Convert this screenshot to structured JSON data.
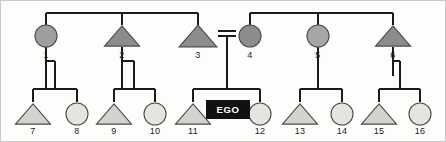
{
  "diagram": {
    "type": "pedigree",
    "width": 446,
    "height": 142,
    "background": "#fdfdfc",
    "border_color": "#c9c9c9",
    "line_color": "#1b1b1b",
    "ego_label": "EGO",
    "ego_box_color": "#111111",
    "ego_text_color": "#ffffff",
    "union_symbol": "=",
    "generations": 2,
    "legend": {
      "male_symbol": "triangle",
      "female_symbol": "circle",
      "ego_symbol": "black-box"
    },
    "fills": {
      "dark_gray": "#8c8c8c",
      "medium_gray": "#9e9e9e",
      "light_gray": "#d8d8d4",
      "pale_gray": "#e8e8e4"
    },
    "persons": [
      {
        "id": "1",
        "label": "1",
        "sex": "female",
        "shape": "circle",
        "generation": 1,
        "fill": "#9e9e9e",
        "cx": 45,
        "cy": 35,
        "r": 11,
        "label_x": 45,
        "label_y": 57
      },
      {
        "id": "2",
        "label": "2",
        "sex": "male",
        "shape": "triangle",
        "generation": 1,
        "fill": "#8c8c8c",
        "cx": 121,
        "cy": 35,
        "r": 13,
        "label_x": 121,
        "label_y": 57
      },
      {
        "id": "3",
        "label": "3",
        "sex": "male",
        "shape": "triangle",
        "generation": 1,
        "fill": "#8c8c8c",
        "cx": 197,
        "cy": 35,
        "r": 14,
        "label_x": 197,
        "label_y": 57
      },
      {
        "id": "4",
        "label": "4",
        "sex": "female",
        "shape": "circle",
        "generation": 1,
        "fill": "#8c8c8c",
        "cx": 249,
        "cy": 35,
        "r": 11,
        "label_x": 249,
        "label_y": 57
      },
      {
        "id": "5",
        "label": "5",
        "sex": "female",
        "shape": "circle",
        "generation": 1,
        "fill": "#a6a6a6",
        "cx": 317,
        "cy": 35,
        "r": 11,
        "label_x": 317,
        "label_y": 57
      },
      {
        "id": "6",
        "label": "6",
        "sex": "male",
        "shape": "triangle",
        "generation": 1,
        "fill": "#8c8c8c",
        "cx": 392,
        "cy": 35,
        "r": 13,
        "label_x": 392,
        "label_y": 57
      },
      {
        "id": "7",
        "label": "7",
        "sex": "male",
        "shape": "triangle",
        "generation": 2,
        "fill": "#d2d2ce",
        "cx": 32,
        "cy": 113,
        "r": 13,
        "label_x": 32,
        "label_y": 133
      },
      {
        "id": "8",
        "label": "8",
        "sex": "female",
        "shape": "circle",
        "generation": 2,
        "fill": "#e4e4e0",
        "cx": 76,
        "cy": 113,
        "r": 11,
        "label_x": 76,
        "label_y": 133
      },
      {
        "id": "9",
        "label": "9",
        "sex": "male",
        "shape": "triangle",
        "generation": 2,
        "fill": "#d2d2ce",
        "cx": 113,
        "cy": 113,
        "r": 13,
        "label_x": 113,
        "label_y": 133
      },
      {
        "id": "10",
        "label": "10",
        "sex": "female",
        "shape": "circle",
        "generation": 2,
        "fill": "#e4e4e0",
        "cx": 154,
        "cy": 113,
        "r": 11,
        "label_x": 154,
        "label_y": 133
      },
      {
        "id": "11",
        "label": "11",
        "sex": "male",
        "shape": "triangle",
        "generation": 2,
        "fill": "#d2d2ce",
        "cx": 192,
        "cy": 113,
        "r": 13,
        "label_x": 192,
        "label_y": 133
      },
      {
        "id": "12",
        "label": "12",
        "sex": "female",
        "shape": "circle",
        "generation": 2,
        "fill": "#e4e4e0",
        "cx": 259,
        "cy": 113,
        "r": 11,
        "label_x": 259,
        "label_y": 133
      },
      {
        "id": "13",
        "label": "13",
        "sex": "male",
        "shape": "triangle",
        "generation": 2,
        "fill": "#d2d2ce",
        "cx": 299,
        "cy": 113,
        "r": 13,
        "label_x": 299,
        "label_y": 133
      },
      {
        "id": "14",
        "label": "14",
        "sex": "female",
        "shape": "circle",
        "generation": 2,
        "fill": "#e4e4e0",
        "cx": 341,
        "cy": 113,
        "r": 11,
        "label_x": 341,
        "label_y": 133
      },
      {
        "id": "15",
        "label": "15",
        "sex": "male",
        "shape": "triangle",
        "generation": 2,
        "fill": "#d2d2ce",
        "cx": 378,
        "cy": 113,
        "r": 13,
        "label_x": 378,
        "label_y": 133
      },
      {
        "id": "16",
        "label": "16",
        "sex": "female",
        "shape": "circle",
        "generation": 2,
        "fill": "#e4e4e0",
        "cx": 419,
        "cy": 113,
        "r": 11,
        "label_x": 419,
        "label_y": 133
      }
    ],
    "ego": {
      "label": "EGO",
      "x": 205,
      "y": 99,
      "width": 44,
      "height": 19
    },
    "sibship_bars": [
      {
        "name": "top-left-sibship",
        "x1": 45,
        "x2": 197,
        "y": 12,
        "stem_x": 121,
        "stem_top": 12,
        "stem_bottom": 4
      },
      {
        "name": "top-right-sibship",
        "x1": 249,
        "x2": 392,
        "y": 12,
        "stem_x": 317,
        "stem_top": 12,
        "stem_bottom": 4
      }
    ],
    "bottom_sibship_bars": [
      {
        "name": "sibship-7-8",
        "x1": 32,
        "x2": 76,
        "y": 88,
        "stem_x": 54
      },
      {
        "name": "sibship-9-10",
        "x1": 113,
        "x2": 154,
        "y": 88,
        "stem_x": 133
      },
      {
        "name": "sibship-ego",
        "x1": 192,
        "x2": 259,
        "y": 88,
        "stem_x": 226
      },
      {
        "name": "sibship-13-14",
        "x1": 299,
        "x2": 341,
        "y": 88,
        "stem_x": 317
      },
      {
        "name": "sibship-15-16",
        "x1": 378,
        "x2": 419,
        "y": 88,
        "stem_x": 399
      }
    ],
    "union": {
      "name": "union-3-4",
      "x": 226,
      "y_upper": 30,
      "y_lower": 35,
      "half_width": 9,
      "descent_top": 35,
      "descent_bottom": 88
    }
  }
}
